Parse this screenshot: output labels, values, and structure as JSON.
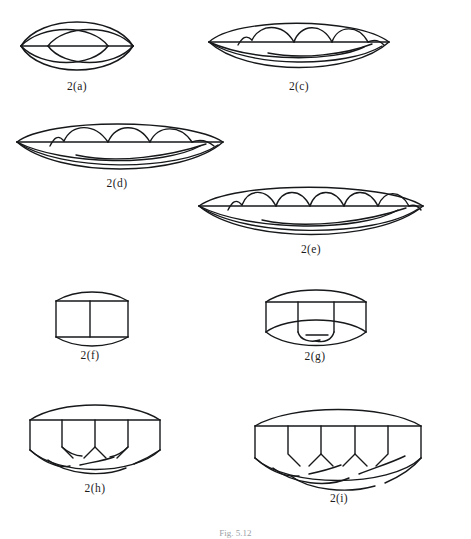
{
  "figure": {
    "caption": "Fig. 5.12",
    "page_background": "#ffffff",
    "ink_color": "#16181a",
    "diagram_count": 9
  },
  "diagrams": [
    {
      "id": "2a",
      "label": "2(a)",
      "type": "lens-link",
      "description": "Two-strand closed braid: outer lens with horizontal axis chord and two overlapping inner lenses",
      "strands": 2,
      "crossings": 2,
      "x": 18,
      "y": 16,
      "width": 118,
      "height": 58,
      "label_x": 48,
      "label_y": 80,
      "label_width": 58
    },
    {
      "id": "2c",
      "label": "2(c)",
      "type": "lens-link",
      "description": "Closed braid with four upper scallop arcs and nested lower arcs",
      "strands": 4,
      "crossings": 4,
      "x": 206,
      "y": 20,
      "width": 186,
      "height": 55,
      "label_x": 270,
      "label_y": 80,
      "label_width": 58
    },
    {
      "id": "2d",
      "label": "2(d)",
      "type": "lens-link",
      "description": "Closed braid with four upper scallop arcs and three nested lower arcs",
      "strands": 4,
      "crossings": 5,
      "x": 14,
      "y": 122,
      "width": 212,
      "height": 56,
      "label_x": 88,
      "label_y": 177,
      "label_width": 58
    },
    {
      "id": "2e",
      "label": "2(e)",
      "type": "lens-link",
      "description": "Closed braid with six upper scallop arcs and three nested lower arcs",
      "strands": 6,
      "crossings": 7,
      "x": 196,
      "y": 186,
      "width": 228,
      "height": 58,
      "label_x": 282,
      "label_y": 243,
      "label_width": 58
    },
    {
      "id": "2f",
      "label": "2(f)",
      "type": "drum-link",
      "description": "Rectangle with convex top and bottom arcs and one central vertical strand",
      "strands": 1,
      "crossings": 0,
      "x": 48,
      "y": 291,
      "width": 85,
      "height": 56,
      "label_x": 61,
      "label_y": 349,
      "label_width": 58
    },
    {
      "id": "2g",
      "label": "2(g)",
      "type": "drum-link",
      "description": "Drum shape with two descending vertical strands that cross below the lower arc",
      "strands": 2,
      "crossings": 2,
      "x": 256,
      "y": 288,
      "width": 118,
      "height": 62,
      "label_x": 286,
      "label_y": 350,
      "label_width": 58
    },
    {
      "id": "2h",
      "label": "2(h)",
      "type": "drum-link",
      "description": "Wide drum with three descending strands meeting in chevrons and crossing lower arcs",
      "strands": 3,
      "crossings": 4,
      "x": 18,
      "y": 402,
      "width": 152,
      "height": 78,
      "label_x": 66,
      "label_y": 482,
      "label_width": 58
    },
    {
      "id": "2i",
      "label": "2(i)",
      "type": "drum-link",
      "description": "Wide drum with four descending strands meeting in chevrons and three crossing lower arcs",
      "strands": 4,
      "crossings": 6,
      "x": 243,
      "y": 406,
      "width": 188,
      "height": 84,
      "label_x": 310,
      "label_y": 492,
      "label_width": 58
    }
  ]
}
